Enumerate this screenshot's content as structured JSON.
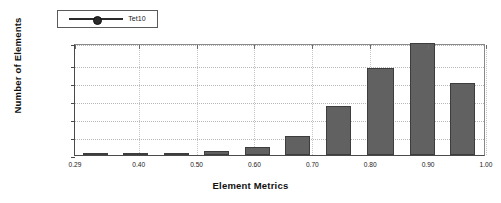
{
  "legend": {
    "entries": [
      {
        "label": "Tet10",
        "marker": "circle-line-marker",
        "color": "#2b2b2b"
      }
    ]
  },
  "axes": {
    "ylabel": "Number of Elements",
    "xlabel": "Element Metrics",
    "yticks": [
      "0.00",
      "4000.00",
      "8000.00",
      "12000.00",
      "16000.00",
      "20000.00",
      "24880.00"
    ],
    "ytick_values": [
      0,
      4000,
      8000,
      12000,
      16000,
      20000,
      24880
    ],
    "xticks": [
      "0.29",
      "0.40",
      "0.50",
      "0.60",
      "0.70",
      "0.80",
      "0.90",
      "1.00"
    ],
    "xtick_values": [
      0.29,
      0.4,
      0.5,
      0.6,
      0.7,
      0.8,
      0.9,
      1.0
    ]
  },
  "style": {
    "bar_fill": "#616161",
    "bar_stroke": "#3d3d3d",
    "grid_color": "#b9b9b9",
    "axis_color": "#4a4a4a",
    "background": "#ffffff"
  },
  "chart_data": {
    "type": "bar",
    "title": "",
    "xlabel": "Element Metrics",
    "ylabel": "Number of Elements",
    "xlim": [
      0.29,
      1.0
    ],
    "ylim": [
      0,
      24880
    ],
    "grid": true,
    "legend_position": "top-left",
    "series": [
      {
        "name": "Tet10",
        "bin_centers": [
          0.325,
          0.395,
          0.465,
          0.535,
          0.605,
          0.675,
          0.745,
          0.82,
          0.89,
          0.96
        ],
        "bin_edges": [
          0.29,
          0.36,
          0.43,
          0.5,
          0.57,
          0.64,
          0.71,
          0.78,
          0.855,
          0.925,
          0.995
        ],
        "values": [
          150,
          200,
          400,
          800,
          1700,
          4300,
          10800,
          19300,
          24880,
          15900
        ]
      }
    ],
    "categories": [
      "0.29-0.36",
      "0.36-0.43",
      "0.43-0.50",
      "0.50-0.57",
      "0.57-0.64",
      "0.64-0.71",
      "0.71-0.78",
      "0.78-0.855",
      "0.855-0.925",
      "0.925-0.995"
    ],
    "values": [
      150,
      200,
      400,
      800,
      1700,
      4300,
      10800,
      19300,
      24880,
      15900
    ]
  }
}
